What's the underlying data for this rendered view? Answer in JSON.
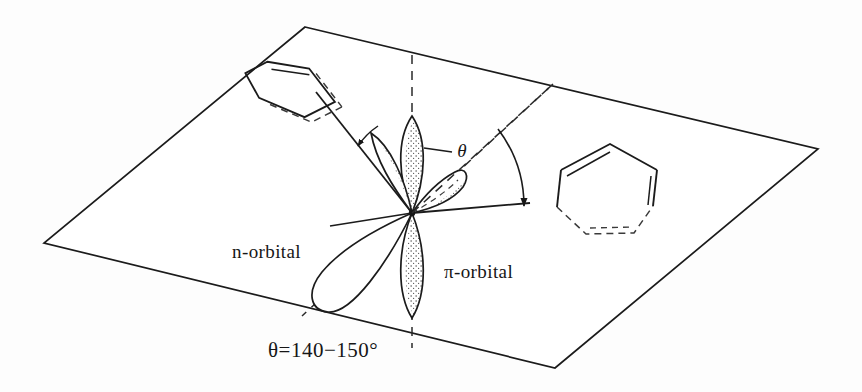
{
  "figure": {
    "kind": "chemical-orbital-geometry-diagram",
    "background_color": "#fdfdfd",
    "ink_color": "#161616",
    "labels": {
      "n_orbital": "n-orbital",
      "pi_orbital": "π-orbital",
      "angle_symbol": "θ",
      "caption": "θ=140−150°"
    },
    "angle": {
      "symbol": "θ",
      "value_text": "140−150°",
      "min_degrees": 140,
      "max_degrees": 150,
      "unit": "°"
    },
    "plane": {
      "name": "molecular-plane",
      "shape": "parallelogram",
      "corners": "305,27 818,149 555,368 44,243"
    },
    "geometry": {
      "node_x": 412,
      "node_y": 213,
      "pi_axis": "vertical dashed",
      "n_axis": "diagonal dashed",
      "lobe_count": 4,
      "ring_count": 2
    }
  }
}
